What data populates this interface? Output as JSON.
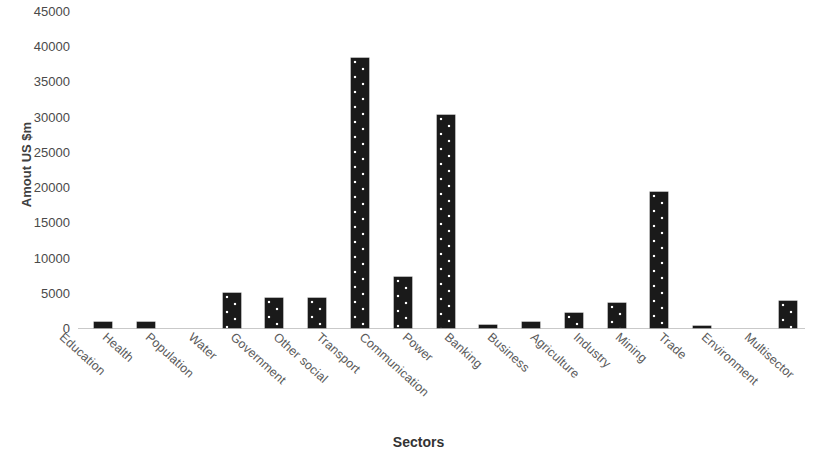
{
  "chart_data": {
    "type": "bar",
    "title": "",
    "xlabel": "Sectors",
    "ylabel": "Amout US $m",
    "ylim": [
      0,
      45000
    ],
    "ytick_step": 5000,
    "yticks": [
      "0",
      "5000",
      "10000",
      "15000",
      "20000",
      "25000",
      "30000",
      "35000",
      "40000",
      "45000"
    ],
    "grid": false,
    "legend": "none",
    "bar_color": "#1a1a1a",
    "bar_pattern": "white-dot-texture",
    "categories": [
      "Education",
      "Health",
      "Population",
      "Water",
      "Government",
      "Other social",
      "Transport",
      "Communication",
      "Power",
      "Banking",
      "Business",
      "Agriculture",
      "Industry",
      "Mining",
      "Trade",
      "Environment",
      "Multisector"
    ],
    "values": [
      900,
      800,
      0,
      4900,
      4200,
      4200,
      38400,
      7200,
      30300,
      400,
      900,
      2100,
      3500,
      19300,
      300,
      0,
      3800
    ]
  }
}
